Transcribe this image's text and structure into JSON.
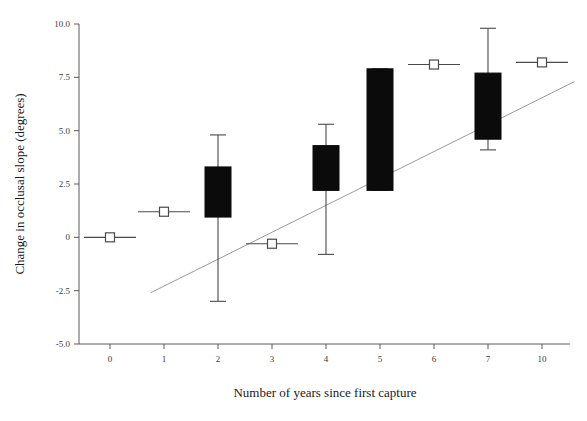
{
  "chart_data": {
    "type": "bar",
    "chart_kind": "box-plot-with-regression-line",
    "title": "",
    "xlabel": "Number of years since first capture",
    "ylabel": "Change in occlusal slope (degrees)",
    "categories": [
      "0",
      "1",
      "2",
      "3",
      "4",
      "5",
      "6",
      "7",
      "10"
    ],
    "x_tick_labels": [
      "0",
      "1",
      "2",
      "3",
      "4",
      "5",
      "6",
      "7",
      "10"
    ],
    "y_tick_labels": [
      "10.0",
      "7.5",
      "5.0",
      "2.5",
      "0",
      "-2.5",
      "-5.0"
    ],
    "y_tick_values": [
      10.0,
      7.5,
      5.0,
      2.5,
      0,
      -2.5,
      -5.0
    ],
    "ylim": [
      -5.0,
      10.0
    ],
    "grid": false,
    "legend": false,
    "legend_position": "none",
    "box_color": "#0b0b0b",
    "whisker_color": "#4a4a4a",
    "line_color": "#9a9a9a",
    "axis_color": "#5a5a5a",
    "boxes": [
      {
        "category": "0",
        "whisker_low": 0.0,
        "q1": 0.0,
        "median": 0.0,
        "q3": 0.0,
        "whisker_high": 0.0,
        "style": "point-marker"
      },
      {
        "category": "1",
        "whisker_low": 1.2,
        "q1": 1.15,
        "median": 1.2,
        "q3": 1.25,
        "whisker_high": 1.2,
        "style": "point-marker"
      },
      {
        "category": "2",
        "whisker_low": -3.0,
        "q1": 0.95,
        "median": 2.1,
        "q3": 3.3,
        "whisker_high": 4.8,
        "style": "box"
      },
      {
        "category": "3",
        "whisker_low": -0.3,
        "q1": -0.35,
        "median": -0.3,
        "q3": -0.25,
        "whisker_high": -0.3,
        "style": "point-marker"
      },
      {
        "category": "4",
        "whisker_low": -0.8,
        "q1": 2.2,
        "median": 3.2,
        "q3": 4.3,
        "whisker_high": 5.3,
        "style": "box"
      },
      {
        "category": "5",
        "whisker_low": 2.2,
        "q1": 2.2,
        "median": 5.1,
        "q3": 7.9,
        "whisker_high": 7.9,
        "style": "box"
      },
      {
        "category": "6",
        "whisker_low": 8.1,
        "q1": 8.05,
        "median": 8.1,
        "q3": 8.15,
        "whisker_high": 8.1,
        "style": "point-marker"
      },
      {
        "category": "7",
        "whisker_low": 4.1,
        "q1": 4.6,
        "median": 6.1,
        "q3": 7.7,
        "whisker_high": 9.8,
        "style": "box"
      },
      {
        "category": "10",
        "whisker_low": 8.2,
        "q1": 8.15,
        "median": 8.2,
        "q3": 8.25,
        "whisker_high": 8.2,
        "style": "point-marker"
      }
    ],
    "regression_line": {
      "x_start_category_index": 0.75,
      "y_start": -2.6,
      "x_end_category_index": 8.6,
      "y_end": 7.3
    }
  }
}
